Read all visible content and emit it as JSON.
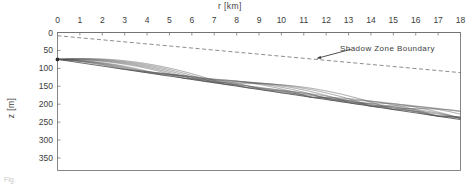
{
  "figure": {
    "caption_partial": "Fig."
  },
  "axes": {
    "x": {
      "title": "r [km]",
      "unit": "km",
      "ticks": [
        0,
        1,
        2,
        3,
        4,
        5,
        6,
        7,
        8,
        9,
        10,
        11,
        12,
        13,
        14,
        15,
        16,
        17,
        18
      ],
      "min": 0,
      "max": 18,
      "position": "top"
    },
    "y": {
      "title": "z [m]",
      "unit": "m",
      "ticks": [
        0,
        50,
        100,
        150,
        200,
        250,
        300,
        350
      ],
      "min": 0,
      "max": 385,
      "direction": "down",
      "position": "left"
    }
  },
  "annotations": [
    {
      "name": "shadow-zone-boundary",
      "text": "Shadow Zone Boundary",
      "arrow_from_r": 13.1,
      "arrow_from_z": 47,
      "arrow_to_r": 11.6,
      "arrow_to_z": 72
    }
  ],
  "colors": {
    "ray": "#595959",
    "boundary": "#6e6e6e",
    "frame": "#777777",
    "text": "#3c3c3c"
  },
  "chart_data": {
    "type": "line",
    "title": "",
    "xlabel": "r [km]",
    "ylabel": "z [m]",
    "xlim": [
      0,
      18
    ],
    "ylim": [
      0,
      385
    ],
    "y_inverted": true,
    "grid": false,
    "legend": null,
    "source": {
      "r": 0.0,
      "z": 75
    },
    "bottom_slope": {
      "r_start": 0,
      "z_start": 75,
      "r_end": 18,
      "z_end": 243
    },
    "surface": {
      "r_start": 0,
      "z_start": 0,
      "r_end": 18,
      "z_end": 0
    },
    "shadow_zone_boundary": {
      "style": "dashed",
      "r_start": 0,
      "z_start": 9,
      "r_end": 18,
      "z_end": 112
    },
    "series": [
      {
        "name": "ray-1",
        "launch_angle_deg": -13.0
      },
      {
        "name": "ray-2",
        "launch_angle_deg": -10.5
      },
      {
        "name": "ray-3",
        "launch_angle_deg": -8.0
      },
      {
        "name": "ray-4",
        "launch_angle_deg": -5.5
      },
      {
        "name": "ray-5",
        "launch_angle_deg": -3.0
      },
      {
        "name": "ray-6",
        "launch_angle_deg": 3.0
      },
      {
        "name": "ray-7",
        "launch_angle_deg": 5.5
      },
      {
        "name": "ray-8",
        "launch_angle_deg": 8.0
      },
      {
        "name": "ray-9",
        "launch_angle_deg": 10.5
      },
      {
        "name": "ray-10",
        "launch_angle_deg": 13.0
      }
    ]
  }
}
